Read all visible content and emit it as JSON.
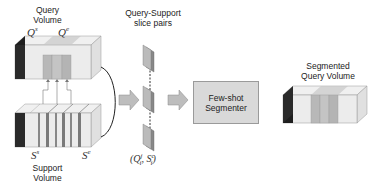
{
  "labels": {
    "query_volume": "Query\nVolume",
    "support_volume": "Support\nVolume",
    "slice_pairs": "Query-Support\nslice pairs",
    "segmenter": "Few-shot\nSegmenter",
    "segmented_volume": "Segmented\nQuery Volume"
  },
  "math": {
    "q_start": "Q",
    "q_start_sup": "s",
    "q_end": "Q",
    "q_end_sup": "e",
    "s_start": "S",
    "s_start_sup": "s",
    "s_end": "S",
    "s_end_sup": "e",
    "pair_open": "(",
    "pair_q": "Q",
    "pair_q_sup": "j",
    "pair_q_sub": "i",
    "pair_sep": ", ",
    "pair_s": "S",
    "pair_s_sup": "c",
    "pair_s_sub": "i",
    "pair_close": ")"
  },
  "colors": {
    "box_front": "#e6e6e6",
    "box_top": "#f0f0f0",
    "box_side_dark": "#1a1a1a",
    "highlight_slice": "#b8b8b8",
    "arrow_fill": "#bdbdbd",
    "segmenter_fill": "#d9d9d9"
  }
}
